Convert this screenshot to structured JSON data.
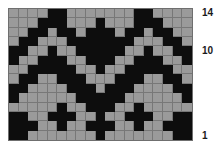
{
  "chart": {
    "title": "",
    "type": "knitting-chart",
    "columns": 19,
    "rows": 14,
    "colors": {
      "background_cell": "#9a9a9a",
      "marked_cell": "#0d0d0d",
      "gridline": "#777777",
      "border": "#6f6f6f",
      "page_background": "#ffffff",
      "label_text": "#1a1a1a"
    }
  },
  "row_labels": [
    {
      "text": "14",
      "row": 14
    },
    {
      "text": "10",
      "row": 10
    },
    {
      "text": "1",
      "row": 1
    }
  ],
  "chart_data": {
    "type": "heatmap",
    "title": "",
    "subtitle": "",
    "xlabel": "",
    "ylabel": "",
    "legend": [],
    "grid": true,
    "legend_position": "none",
    "x": [
      1,
      2,
      3,
      4,
      5,
      6,
      7,
      8,
      9,
      10,
      11,
      12,
      13,
      14,
      15,
      16,
      17,
      18,
      19
    ],
    "categories": [
      "1",
      "2",
      "3",
      "4",
      "5",
      "6",
      "7",
      "8",
      "9",
      "10",
      "11",
      "12",
      "13",
      "14",
      "15",
      "16",
      "17",
      "18",
      "19"
    ],
    "y_tick_labels": [
      "1",
      "10",
      "14"
    ],
    "ylim": [
      1,
      14
    ],
    "value_map": {
      "0": "#9a9a9a",
      "1": "#0d0d0d"
    },
    "value_names": {
      "0": "background",
      "1": "contrast"
    },
    "rows_top_to_bottom": [
      [
        0,
        0,
        0,
        0,
        1,
        1,
        0,
        0,
        0,
        0,
        0,
        0,
        0,
        1,
        1,
        0,
        0,
        0,
        0
      ],
      [
        0,
        0,
        0,
        1,
        1,
        1,
        0,
        0,
        0,
        1,
        0,
        0,
        0,
        1,
        1,
        1,
        0,
        0,
        0
      ],
      [
        0,
        0,
        1,
        1,
        0,
        1,
        1,
        0,
        1,
        1,
        1,
        0,
        1,
        1,
        0,
        1,
        1,
        0,
        0
      ],
      [
        0,
        1,
        1,
        0,
        0,
        0,
        1,
        1,
        1,
        1,
        1,
        1,
        1,
        0,
        0,
        0,
        1,
        1,
        0
      ],
      [
        1,
        1,
        0,
        0,
        1,
        0,
        0,
        1,
        1,
        1,
        1,
        1,
        0,
        0,
        1,
        0,
        0,
        1,
        1
      ],
      [
        1,
        0,
        0,
        1,
        1,
        1,
        0,
        0,
        1,
        1,
        1,
        0,
        0,
        1,
        1,
        1,
        0,
        0,
        1
      ],
      [
        0,
        0,
        1,
        1,
        1,
        1,
        1,
        0,
        0,
        1,
        0,
        0,
        1,
        1,
        1,
        1,
        1,
        0,
        0
      ],
      [
        0,
        1,
        1,
        0,
        0,
        1,
        1,
        1,
        0,
        0,
        0,
        1,
        1,
        1,
        0,
        0,
        1,
        1,
        0
      ],
      [
        1,
        1,
        0,
        0,
        0,
        0,
        1,
        1,
        1,
        0,
        1,
        1,
        1,
        0,
        0,
        0,
        0,
        1,
        1
      ],
      [
        1,
        0,
        0,
        0,
        0,
        0,
        0,
        1,
        1,
        1,
        1,
        1,
        0,
        0,
        0,
        0,
        0,
        0,
        1
      ],
      [
        0,
        0,
        0,
        0,
        0,
        1,
        0,
        0,
        1,
        1,
        1,
        0,
        0,
        1,
        0,
        0,
        0,
        0,
        0
      ],
      [
        1,
        1,
        0,
        0,
        1,
        1,
        1,
        0,
        0,
        1,
        0,
        0,
        1,
        1,
        1,
        0,
        0,
        1,
        1
      ],
      [
        1,
        1,
        1,
        0,
        0,
        1,
        0,
        0,
        1,
        1,
        1,
        0,
        0,
        1,
        0,
        0,
        1,
        1,
        1
      ],
      [
        1,
        1,
        0,
        0,
        0,
        0,
        0,
        0,
        0,
        1,
        0,
        0,
        0,
        0,
        0,
        0,
        0,
        1,
        1
      ]
    ]
  }
}
